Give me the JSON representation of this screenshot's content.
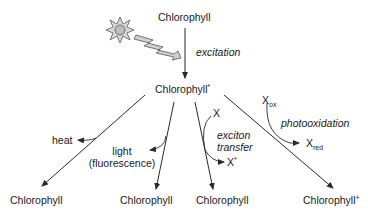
{
  "diagram": {
    "nodes": {
      "ground_top": "Chlorophyll",
      "excited": "Chlorophyll",
      "excited_sup": "*",
      "bottom_1": "Chlorophyll",
      "bottom_2": "Chlorophyll",
      "bottom_3": "Chlorophyll",
      "bottom_4": "Chlorophyll",
      "bottom_4_sup": "+"
    },
    "labels": {
      "excitation": "excitation",
      "heat": "heat",
      "light_line1": "light",
      "light_line2": "(fluorescence)",
      "x_in": "X",
      "exciton_line1": "exciton",
      "exciton_line2": "transfer",
      "x_star": "X",
      "x_star_sup": "*",
      "x_ox": "X",
      "x_ox_sub": "ox",
      "photooxidation": "photooxidation",
      "x_red": "X",
      "x_red_sub": "red"
    },
    "icons": {
      "sun": "sun-icon",
      "lightning": "lightning-bolt-icon"
    },
    "colors": {
      "line": "#2a2a2a",
      "text": "#1a1a1a",
      "icon_fill": "#c8c8c8",
      "icon_stroke": "#555555"
    }
  }
}
